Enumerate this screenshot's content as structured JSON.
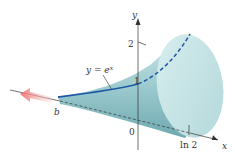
{
  "figure": {
    "curve_label": "y = e",
    "curve_label_exp": "x",
    "axis_x_label": "x",
    "axis_y_label": "y",
    "tick_y_1": "1",
    "tick_y_2": "2",
    "origin_label": "0",
    "tick_x_ln2": "ln 2",
    "left_limit_label": "b"
  },
  "colors": {
    "solid_fill": "#a9d3d6",
    "solid_dark": "#7fb5bb",
    "end_cap": "#c6e4e5",
    "curve": "#1f5aa6",
    "arrow": "#f08a8a",
    "axis": "#333333"
  }
}
